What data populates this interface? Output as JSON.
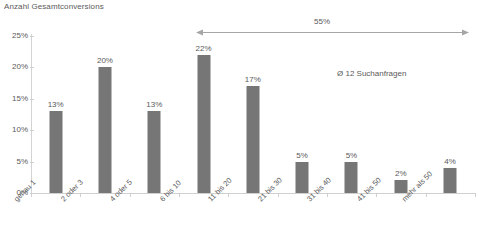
{
  "chart_data": {
    "type": "bar",
    "title": "Anzahl Gesamtconversions",
    "xlabel": "",
    "ylabel": "",
    "ylim": [
      0,
      25
    ],
    "grid": false,
    "legend": "none",
    "categories": [
      "genau 1",
      "2 oder 3",
      "4 oder 5",
      "6 bis 10",
      "11 bis 20",
      "21 bis 30",
      "31 bis 40",
      "41 bis 50",
      "mehr als 50"
    ],
    "values": [
      13,
      20,
      13,
      22,
      17,
      5,
      5,
      2,
      4
    ],
    "value_labels": [
      "13%",
      "20%",
      "13%",
      "22%",
      "17%",
      "5%",
      "5%",
      "2%",
      "4%"
    ],
    "yticks": [
      0,
      5,
      10,
      15,
      20,
      25
    ],
    "ytick_labels": [
      "0%",
      "5%",
      "10%",
      "15%",
      "20%",
      "25%"
    ],
    "bar_color": "#767676",
    "text_color": "#5a5a5a",
    "axis_color": "#d0d0d0",
    "annotations": [
      {
        "name": "range-arrow",
        "label": "55%",
        "from_category": "6 bis 10",
        "to_category": "mehr als 50",
        "style": "double-headed-arrow"
      },
      {
        "name": "average-note",
        "label": "Ø 12 Suchanfragen"
      }
    ]
  }
}
